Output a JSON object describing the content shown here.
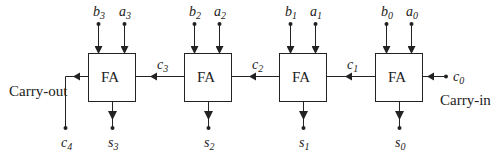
{
  "diagram": {
    "block_label": "FA",
    "carry_out_label": "Carry-out",
    "carry_in_label": "Carry-in",
    "blocks": [
      {
        "index": 3,
        "b": "b",
        "b_sub": "3",
        "a": "a",
        "a_sub": "3",
        "s": "s",
        "s_sub": "3"
      },
      {
        "index": 2,
        "b": "b",
        "b_sub": "2",
        "a": "a",
        "a_sub": "2",
        "s": "s",
        "s_sub": "2"
      },
      {
        "index": 1,
        "b": "b",
        "b_sub": "1",
        "a": "a",
        "a_sub": "1",
        "s": "s",
        "s_sub": "1"
      },
      {
        "index": 0,
        "b": "b",
        "b_sub": "0",
        "a": "a",
        "a_sub": "0",
        "s": "s",
        "s_sub": "0"
      }
    ],
    "carries": [
      {
        "name": "c",
        "sub": "4"
      },
      {
        "name": "c",
        "sub": "3"
      },
      {
        "name": "c",
        "sub": "2"
      },
      {
        "name": "c",
        "sub": "1"
      },
      {
        "name": "c",
        "sub": "0"
      }
    ],
    "colors": {
      "line": "#222222",
      "box_fill": "#ffffff"
    }
  }
}
